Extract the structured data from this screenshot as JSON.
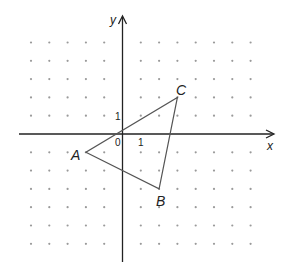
{
  "figure": {
    "axes": {
      "x_label": "x",
      "y_label": "y",
      "origin_label": "0",
      "x_unit_label": "1",
      "y_unit_label": "1",
      "x_range": [
        -5,
        8
      ],
      "y_range": [
        -6,
        5
      ]
    },
    "grid": {
      "style": "dots",
      "x_min": -5,
      "x_max": 7,
      "y_min": -6,
      "y_max": 5
    },
    "triangle": {
      "vertices": [
        {
          "label": "A",
          "x": -2,
          "y": -1
        },
        {
          "label": "B",
          "x": 2,
          "y": -3
        },
        {
          "label": "C",
          "x": 3,
          "y": 2
        }
      ]
    },
    "colors": {
      "axis": "#222222",
      "triangle": "#555555",
      "dot": "#9a9a9a"
    }
  }
}
